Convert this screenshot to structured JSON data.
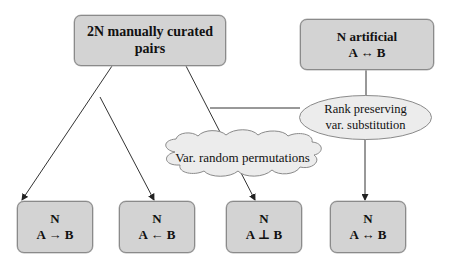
{
  "diagram": {
    "source_node": {
      "label": "2N manually curated pairs"
    },
    "artificial_node": {
      "line1": "N artificial",
      "line2": "A ↔ B"
    },
    "rank_node": {
      "line1": "Rank preserving",
      "line2": "var. substitution",
      "shape": "ellipse"
    },
    "permutation_node": {
      "label": "Var. random permutations",
      "shape": "cloud"
    },
    "outputs": [
      {
        "line1": "N",
        "line2": "A → B"
      },
      {
        "line1": "N",
        "line2": "A ← B"
      },
      {
        "line1": "N",
        "line2": "A ⊥ B"
      },
      {
        "line1": "N",
        "line2": "A ↔ B"
      }
    ],
    "colors": {
      "box_fill": "#d3d3d3",
      "box_border": "#8a8a8a",
      "ellipse_fill": "#ececec",
      "cloud_fill": "#ececec",
      "edge": "#333333"
    }
  }
}
